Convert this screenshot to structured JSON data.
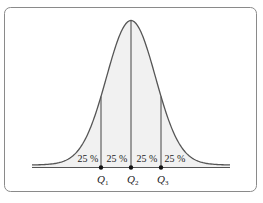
{
  "diagram": {
    "distribution": "normal",
    "segments": [
      {
        "label": "25 %"
      },
      {
        "label": "25 %"
      },
      {
        "label": "25 %"
      },
      {
        "label": "25 %"
      }
    ],
    "quartiles": [
      {
        "symbol": "Q",
        "sub": "1"
      },
      {
        "symbol": "Q",
        "sub": "2"
      },
      {
        "symbol": "Q",
        "sub": "3"
      }
    ],
    "colors": {
      "curve": "#555555",
      "fill": "#f1f1f1",
      "frame": "#8a8a8a",
      "lines": "#444444",
      "text": "#222222"
    }
  }
}
